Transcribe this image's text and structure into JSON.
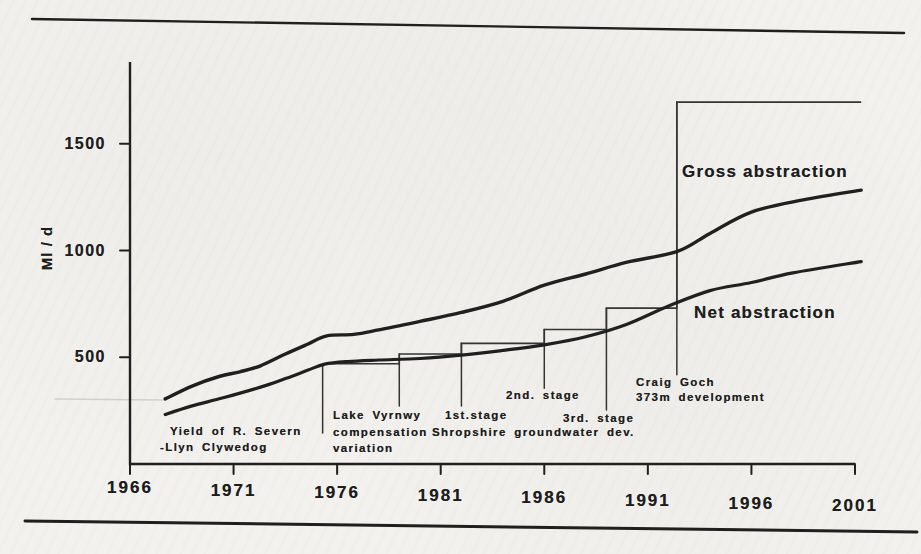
{
  "figure": {
    "paper_color": "#f2f1ee",
    "ink_color": "#1e1e1e",
    "thin_line_color": "#333333",
    "top_rule": {
      "x1": 32,
      "y1": 19,
      "x2": 904,
      "y2": 33
    },
    "bottom_rule": {
      "x1": 25,
      "y1": 521,
      "x2": 917,
      "y2": 532
    },
    "scan_artifact_line": {
      "x1": 55,
      "y1": 399,
      "x2": 163,
      "y2": 400
    }
  },
  "chart_data": {
    "type": "line",
    "title": "",
    "xlabel": "",
    "ylabel": "Ml / d",
    "xlim": [
      1966,
      2001.3
    ],
    "ylim": [
      0,
      1880
    ],
    "x_ticks": [
      1966,
      1971,
      1976,
      1981,
      1986,
      1991,
      1996,
      2001
    ],
    "y_ticks": [
      500,
      1000,
      1500
    ],
    "grid": false,
    "legend": "inline-labels",
    "series": [
      {
        "name": "Gross abstraction",
        "style": "smooth-thick",
        "points": [
          [
            1967.7,
            305
          ],
          [
            1969,
            365
          ],
          [
            1970.3,
            410
          ],
          [
            1971.3,
            432
          ],
          [
            1972.3,
            460
          ],
          [
            1973.5,
            515
          ],
          [
            1974.6,
            562
          ],
          [
            1975.5,
            600
          ],
          [
            1976.8,
            607
          ],
          [
            1978,
            628
          ],
          [
            1980,
            668
          ],
          [
            1982,
            710
          ],
          [
            1984,
            762
          ],
          [
            1986,
            838
          ],
          [
            1988,
            890
          ],
          [
            1990,
            945
          ],
          [
            1992.4,
            995
          ],
          [
            1994,
            1080
          ],
          [
            1996,
            1180
          ],
          [
            1998.5,
            1237
          ],
          [
            2001.3,
            1283
          ]
        ]
      },
      {
        "name": "Net abstraction",
        "style": "smooth-thick",
        "points": [
          [
            1967.7,
            232
          ],
          [
            1969,
            272
          ],
          [
            1970.5,
            310
          ],
          [
            1972.3,
            360
          ],
          [
            1973.5,
            400
          ],
          [
            1974.6,
            440
          ],
          [
            1975.4,
            468
          ],
          [
            1976.5,
            480
          ],
          [
            1978,
            487
          ],
          [
            1980,
            494
          ],
          [
            1982,
            510
          ],
          [
            1984,
            532
          ],
          [
            1986,
            558
          ],
          [
            1988,
            596
          ],
          [
            1990,
            655
          ],
          [
            1992,
            740
          ],
          [
            1994,
            812
          ],
          [
            1996,
            850
          ],
          [
            1998,
            895
          ],
          [
            2001.3,
            948
          ]
        ]
      },
      {
        "name": "yield-steps",
        "style": "step-thin",
        "points": [
          [
            1975.3,
            470
          ],
          [
            1979,
            470
          ],
          [
            1979,
            515
          ],
          [
            1982,
            515
          ],
          [
            1982,
            565
          ],
          [
            1986,
            565
          ],
          [
            1986,
            630
          ],
          [
            1989,
            630
          ],
          [
            1989,
            730
          ],
          [
            1992.4,
            730
          ],
          [
            1992.4,
            1695
          ],
          [
            2001.3,
            1695
          ]
        ]
      }
    ],
    "leader_lines": [
      {
        "x": 1975.3,
        "from": 470,
        "to": 145
      },
      {
        "x": 1979,
        "from": 515,
        "to": 272
      },
      {
        "x": 1982,
        "from": 565,
        "to": 272
      },
      {
        "x": 1986,
        "from": 630,
        "to": 355
      },
      {
        "x": 1989,
        "from": 730,
        "to": 253
      },
      {
        "x": 1992.4,
        "from": 1695,
        "to": 418
      }
    ],
    "annotations": [
      {
        "name": "yield-severn-clywedog",
        "lines": [
          {
            "text": "Yield of R. Severn",
            "x": 170,
            "y": 426
          },
          {
            "text": "-Llyn Clywedog",
            "x": 160,
            "y": 442
          }
        ]
      },
      {
        "name": "lake-vyrnwy-compensation",
        "lines": [
          {
            "text": "Lake Vyrnwy",
            "x": 333,
            "y": 410
          },
          {
            "text": "compensation",
            "x": 333,
            "y": 427
          },
          {
            "text": "variation",
            "x": 333,
            "y": 443
          }
        ]
      },
      {
        "name": "shropshire-1st-stage",
        "lines": [
          {
            "text": "1st.stage",
            "x": 445,
            "y": 410
          },
          {
            "text": "Shropshire groundwater dev.",
            "x": 432,
            "y": 427
          }
        ]
      },
      {
        "name": "shropshire-2nd-stage",
        "lines": [
          {
            "text": "2nd. stage",
            "x": 506,
            "y": 390
          }
        ]
      },
      {
        "name": "shropshire-3rd-stage",
        "lines": [
          {
            "text": "3rd. stage",
            "x": 563,
            "y": 413
          }
        ]
      },
      {
        "name": "craig-goch",
        "lines": [
          {
            "text": "Craig Goch",
            "x": 636,
            "y": 377
          },
          {
            "text": "373m development",
            "x": 636,
            "y": 392
          }
        ]
      }
    ]
  }
}
